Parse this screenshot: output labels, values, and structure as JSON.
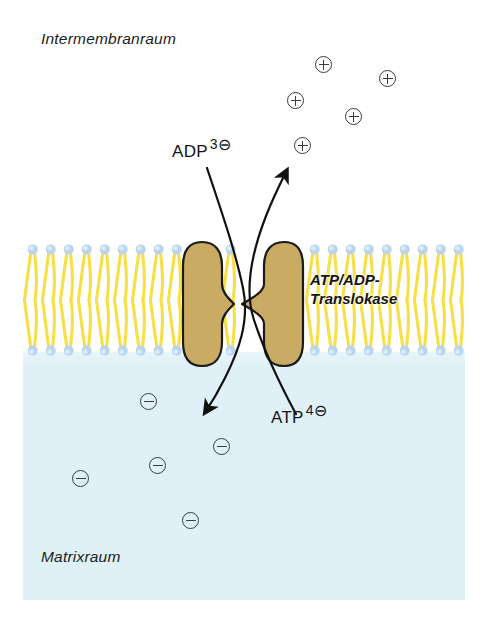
{
  "diagram": {
    "title_alt": "ATP/ADP-Translokase an der inneren Mitochondrienmembran",
    "regions": {
      "top": {
        "label": "Intermembranraum"
      },
      "bottom": {
        "label": "Matrixraum"
      }
    },
    "protein": {
      "caption_line1": "ATP/ADP-",
      "caption_line2": "Translokase",
      "color": "#c9ab63",
      "outline": "#1a1a1a"
    },
    "membrane": {
      "head_color": "#b9d4ec",
      "tail_color": "#f6e04a",
      "lipid_count": 24
    },
    "molecules": [
      {
        "name": "ADP",
        "charge_number": "3",
        "charge_symbol": "⊖",
        "direction": "into-matrix"
      },
      {
        "name": "ATP",
        "charge_number": "4",
        "charge_symbol": "⊖",
        "direction": "out-of-matrix"
      }
    ],
    "ions": {
      "positive_symbol": "⊕",
      "negative_symbol": "⊖",
      "positive_count": 5,
      "negative_count": 5,
      "positive_positions": [
        {
          "x": 315,
          "y": 56
        },
        {
          "x": 379,
          "y": 70
        },
        {
          "x": 287,
          "y": 92
        },
        {
          "x": 345,
          "y": 108
        },
        {
          "x": 294,
          "y": 137
        }
      ],
      "negative_positions": [
        {
          "x": 140,
          "y": 393
        },
        {
          "x": 213,
          "y": 438
        },
        {
          "x": 149,
          "y": 457
        },
        {
          "x": 72,
          "y": 470
        },
        {
          "x": 182,
          "y": 512
        }
      ]
    },
    "colors": {
      "matrix_fill": "#dff0f7",
      "intermembrane_fill": "#ffffff",
      "arrow_stroke": "#111111",
      "text": "#16161a"
    }
  }
}
